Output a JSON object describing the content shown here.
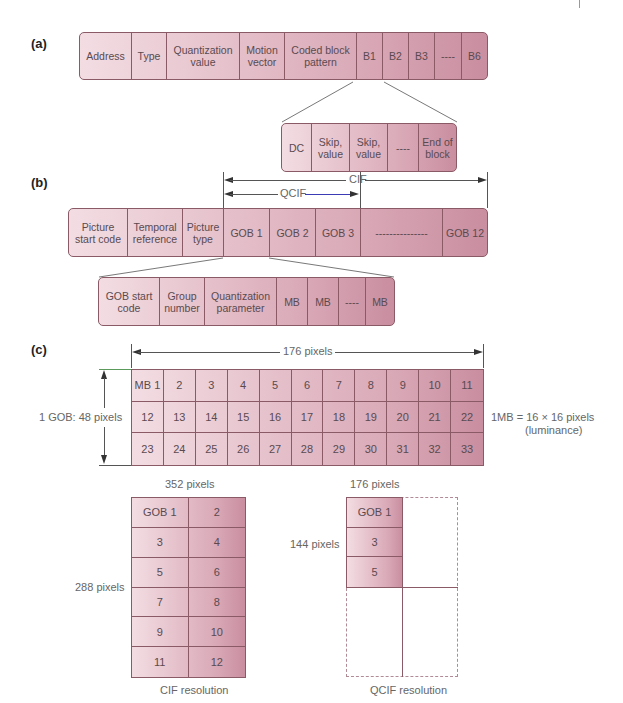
{
  "section_a": {
    "label": "(a)",
    "macroblock_fields": [
      {
        "label": "Address"
      },
      {
        "label": "Type"
      },
      {
        "label": "Quantization value"
      },
      {
        "label": "Motion vector"
      },
      {
        "label": "Coded block pattern"
      },
      {
        "label": "B1"
      },
      {
        "label": "B2"
      },
      {
        "label": "B3"
      },
      {
        "label": "----"
      },
      {
        "label": "B6"
      }
    ],
    "block_fields": [
      {
        "label": "DC"
      },
      {
        "label": "Skip, value"
      },
      {
        "label": "Skip, value"
      },
      {
        "label": "----"
      },
      {
        "label": "End of block"
      }
    ]
  },
  "section_b": {
    "label": "(b)",
    "cif_label": "CIF",
    "qcif_label": "QCIF",
    "picture_fields": [
      {
        "label": "Picture start code"
      },
      {
        "label": "Temporal reference"
      },
      {
        "label": "Picture type"
      },
      {
        "label": "GOB 1"
      },
      {
        "label": "GOB 2"
      },
      {
        "label": "GOB 3"
      },
      {
        "label": "---------------"
      },
      {
        "label": "GOB 12"
      }
    ],
    "gob_fields": [
      {
        "label": "GOB start code"
      },
      {
        "label": "Group number"
      },
      {
        "label": "Quantization parameter"
      },
      {
        "label": "MB"
      },
      {
        "label": "MB"
      },
      {
        "label": "----"
      },
      {
        "label": "MB"
      }
    ]
  },
  "section_c": {
    "label": "(c)",
    "width_label": "176 pixels",
    "height_label": "1 GOB:  48 pixels",
    "mb_note_line1": "1MB = 16 × 16 pixels",
    "mb_note_line2": "(luminance)",
    "macroblocks": [
      "MB 1",
      "2",
      "3",
      "4",
      "5",
      "6",
      "7",
      "8",
      "9",
      "10",
      "11",
      "12",
      "13",
      "14",
      "15",
      "16",
      "17",
      "18",
      "19",
      "20",
      "21",
      "22",
      "23",
      "24",
      "25",
      "26",
      "27",
      "28",
      "29",
      "30",
      "31",
      "32",
      "33"
    ],
    "cif": {
      "width_label": "352 pixels",
      "height_label": "288 pixels",
      "caption": "CIF resolution",
      "gobs": [
        "GOB 1",
        "2",
        "3",
        "4",
        "5",
        "6",
        "7",
        "8",
        "9",
        "10",
        "11",
        "12"
      ]
    },
    "qcif": {
      "width_label": "176 pixels",
      "height_label": "144 pixels",
      "caption": "QCIF resolution",
      "gobs": [
        "GOB 1",
        "3",
        "5"
      ]
    },
    "footnote": "GOB = Group of (macro) blocks"
  },
  "colors": {
    "cell_light": "#f3dde3",
    "cell_dark": "#c98ea0",
    "border": "#8a5a66",
    "qcif_arrow_line": "#3b3bb5"
  }
}
